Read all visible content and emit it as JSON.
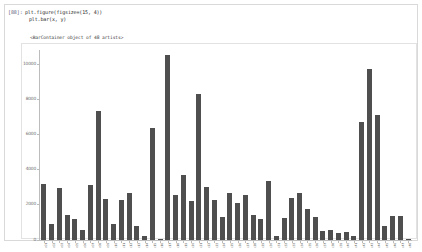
{
  "notebook": {
    "prompt_label": "[88]:",
    "code_lines": [
      "plt.figure(figsize=(15, 4))",
      "plt.bar(x, y)"
    ],
    "text_output": "<BarContainer object of 48 artists>"
  },
  "colors": {
    "bar_fill": "#4f4f4f",
    "axis": "#bcbcbc",
    "tick_text": "#6e6e6e",
    "cell_border": "#d9d9d9",
    "figure_background": "#ffffff"
  },
  "chart_data": {
    "type": "bar",
    "title": "",
    "xlabel": "",
    "ylabel": "",
    "ylim": [
      0,
      10800
    ],
    "grid": false,
    "legend": null,
    "y_ticks": [
      0,
      2000,
      4000,
      6000,
      8000,
      10000
    ],
    "y_tick_labels": [
      "0",
      "2000",
      "4000",
      "6000",
      "8000",
      "10000"
    ],
    "categories": [
      "c01",
      "c02",
      "c03",
      "c04",
      "c05",
      "c06",
      "c07",
      "c08",
      "c09",
      "c10",
      "c11",
      "c12",
      "c13",
      "c14",
      "c15",
      "c16",
      "c17",
      "c18",
      "c19",
      "c20",
      "c21",
      "c22",
      "c23",
      "c24",
      "c25",
      "c26",
      "c27",
      "c28",
      "c29",
      "c30",
      "c31",
      "c32",
      "c33",
      "c34",
      "c35",
      "c36",
      "c37",
      "c38",
      "c39",
      "c40",
      "c41",
      "c42",
      "c43",
      "c44",
      "c45",
      "c46",
      "c47",
      "c48"
    ],
    "values": [
      3200,
      900,
      2950,
      1450,
      1200,
      550,
      3150,
      7350,
      2350,
      900,
      2300,
      2700,
      800,
      200,
      6350,
      60,
      10500,
      2550,
      3700,
      2200,
      8300,
      3000,
      2250,
      1300,
      2650,
      2100,
      2550,
      1400,
      1200,
      3350,
      200,
      1250,
      2400,
      2700,
      1750,
      1300,
      500,
      550,
      400,
      450,
      250,
      6700,
      9700,
      7100,
      800,
      1350,
      1350,
      60
    ]
  }
}
